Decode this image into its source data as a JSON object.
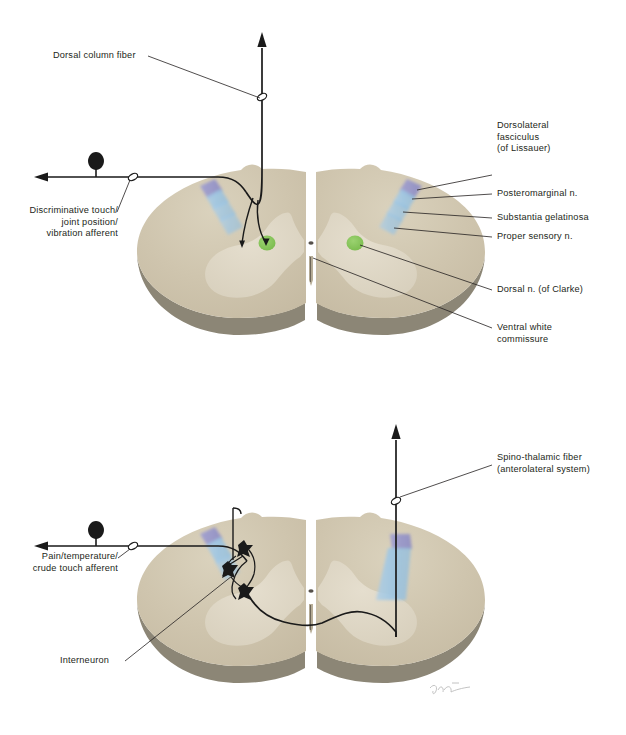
{
  "figure": {
    "panels": [
      {
        "id": "upper",
        "name": "dorsal-column-medial-lemniscus-panel",
        "labels": {
          "dorsal_column_fiber": "Dorsal column fiber",
          "discriminative_afferent": "Discriminative touch/\njoint position/\nvibration afferent",
          "dorsolateral_fasciculus": "Dorsolateral\nfasciculus\n(of Lissauer)",
          "posteromarginal": "Posteromarginal n.",
          "substantia_gelatinosa": "Substantia gelatinosa",
          "proper_sensory": "Proper sensory n.",
          "dorsal_n_clarke": "Dorsal n. (of Clarke)",
          "ventral_white_commissure": "Ventral white\ncommissure"
        }
      },
      {
        "id": "lower",
        "name": "anterolateral-spinothalamic-panel",
        "labels": {
          "pain_afferent": "Pain/temperature/\ncrude touch afferent",
          "interneuron": "Interneuron",
          "spinothalamic_fiber": "Spino-thalamic fiber\n(anterolateral system)"
        }
      }
    ],
    "signature": "artist-signature"
  },
  "colors": {
    "white_matter": "#cfc5ae",
    "white_matter_light": "#d8cfba",
    "gray_matter": "#ded7c5",
    "cord_edge": "#8c8676",
    "cord_edge_dark": "#767060",
    "lissauer_purple": "#8f8fcb",
    "tract_blue": "#9ec6e3",
    "tract_blue_light": "#b3d4ec",
    "nucleus_green": "#7bc24b",
    "fiber_black": "#1a1a1a",
    "leader_line": "#231f20",
    "background": "#ffffff"
  }
}
